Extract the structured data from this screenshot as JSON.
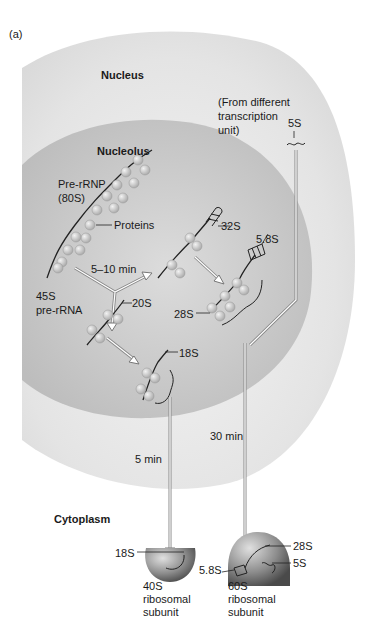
{
  "panel_label": "(a)",
  "compartments": {
    "nucleus": "Nucleus",
    "nucleolus": "Nucleolus",
    "cytoplasm": "Cytoplasm"
  },
  "labels": {
    "pre_rrnp": "Pre-rRNP",
    "pre_rrnp_size": "(80S)",
    "proteins": "Proteins",
    "time_5_10": "5–10 min",
    "pre_rrna_size": "45S",
    "pre_rrna": "pre-rRNA",
    "s32": "32S",
    "s58": "5.8S",
    "s28": "28S",
    "s20": "20S",
    "s18": "18S",
    "from_different_1": "(From different",
    "from_different_2": "transcription",
    "from_different_3": "unit)",
    "s5": "5S",
    "time_30": "30 min",
    "time_5": "5 min"
  },
  "subunits": {
    "small": {
      "size": "40S",
      "line2": "ribosomal",
      "line3": "subunit",
      "rna": "18S"
    },
    "large": {
      "size": "60S",
      "line2": "ribosomal",
      "line3": "subunit",
      "rna_28": "28S",
      "rna_5": "5S",
      "rna_58": "5.8S"
    }
  },
  "colors": {
    "nucleus": "#e6e6e6",
    "nucleolus": "#c9c9c9",
    "protein": "#d8d8d8",
    "subunit": "#8a8a8a"
  }
}
